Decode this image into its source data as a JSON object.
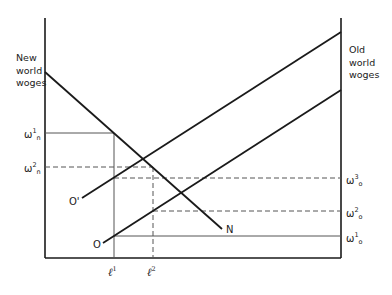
{
  "diagram": {
    "left_axis_title": [
      "New",
      "world",
      "woges"
    ],
    "right_axis_title": [
      "Old",
      "world",
      "woges"
    ],
    "left_labels": [
      {
        "id": "w1n",
        "base": "ω",
        "sup": "1",
        "sub": "n"
      },
      {
        "id": "w2n",
        "base": "ω",
        "sup": "2",
        "sub": "n"
      }
    ],
    "right_labels": [
      {
        "id": "w3o",
        "base": "ω",
        "sup": "3",
        "sub": "o"
      },
      {
        "id": "w2o",
        "base": "ω",
        "sup": "2",
        "sub": "o"
      },
      {
        "id": "w1o",
        "base": "ω",
        "sup": "1",
        "sub": "o"
      }
    ],
    "x_labels": [
      {
        "id": "l1",
        "base": "ℓ",
        "sup": "1"
      },
      {
        "id": "l2",
        "base": "ℓ",
        "sup": "2"
      }
    ],
    "curve_labels": {
      "demand_new": "N",
      "supply_old_shifted": "O'",
      "supply_old": "O"
    },
    "line_color": "#1a1a1a",
    "guide_color": "#555555"
  }
}
